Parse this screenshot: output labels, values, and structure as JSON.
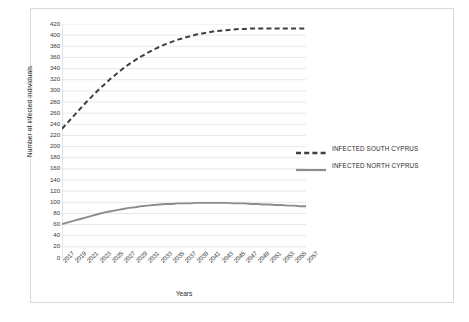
{
  "chart_data": {
    "type": "line",
    "title": "",
    "xlabel": "Years",
    "ylabel": "Number of infected individuals",
    "ylim": [
      0,
      420
    ],
    "ytick_step": 20,
    "yticks": [
      420,
      400,
      380,
      360,
      340,
      320,
      300,
      280,
      260,
      240,
      220,
      200,
      180,
      160,
      140,
      120,
      100,
      80,
      60,
      40,
      20,
      0
    ],
    "grid": true,
    "grid_color": "#d9d9d9",
    "legend_position": "right",
    "x": [
      2017,
      2018,
      2019,
      2020,
      2021,
      2022,
      2023,
      2024,
      2025,
      2026,
      2027,
      2028,
      2029,
      2030,
      2031,
      2032,
      2033,
      2034,
      2035,
      2036,
      2037,
      2038,
      2039,
      2040,
      2041,
      2042,
      2043,
      2044,
      2045,
      2046,
      2047,
      2048,
      2049,
      2050,
      2051,
      2052,
      2053,
      2054,
      2055,
      2056,
      2057
    ],
    "xtick_labels": [
      "2017",
      "2019",
      "2021",
      "2023",
      "2025",
      "2027",
      "2029",
      "2031",
      "2033",
      "2035",
      "2037",
      "2039",
      "2041",
      "2043",
      "2045",
      "2047",
      "2049",
      "2051",
      "2053",
      "2055",
      "2057"
    ],
    "series": [
      {
        "name": "INFECTED SOUTH CYPRUS",
        "style": "dashed",
        "color": "#3f3f3f",
        "values": [
          232,
          244,
          256,
          268,
          280,
          291,
          302,
          312,
          322,
          331,
          340,
          348,
          355,
          362,
          368,
          374,
          379,
          384,
          388,
          392,
          395,
          398,
          401,
          403,
          405,
          407,
          408,
          409,
          410,
          411,
          411,
          412,
          412,
          412,
          412,
          412,
          412,
          412,
          412,
          412,
          412
        ]
      },
      {
        "name": "INFECTED NORTH CYPRUS",
        "style": "solid",
        "color": "#8c8c8c",
        "values": [
          61,
          64,
          67,
          70,
          73,
          76,
          79,
          82,
          84,
          86,
          88,
          90,
          91,
          93,
          94,
          95,
          96,
          97,
          97,
          98,
          98,
          98,
          99,
          99,
          99,
          99,
          99,
          99,
          98,
          98,
          98,
          97,
          97,
          96,
          96,
          95,
          95,
          94,
          94,
          93,
          93
        ]
      }
    ]
  },
  "legend": {
    "items": [
      {
        "label": "INFECTED SOUTH CYPRUS",
        "style": "dashed",
        "color": "#3f3f3f"
      },
      {
        "label": "INFECTED NORTH CYPRUS",
        "style": "solid",
        "color": "#8c8c8c"
      }
    ]
  }
}
